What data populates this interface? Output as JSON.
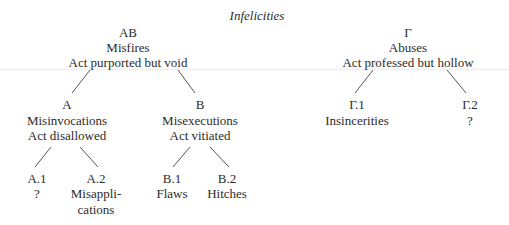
{
  "title": "Infelicities",
  "nodes": {
    "AB": {
      "code": "AB",
      "name": "Misfires",
      "desc": "Act purported but void"
    },
    "Gamma": {
      "code": "Γ",
      "name": "Abuses",
      "desc": "Act professed but hollow"
    },
    "A": {
      "code": "A",
      "name": "Misinvocations",
      "desc": "Act disallowed"
    },
    "B": {
      "code": "B",
      "name": "Misexecutions",
      "desc": "Act vitiated"
    },
    "Gamma1": {
      "code": "Γ.1",
      "name": "Insincerities"
    },
    "Gamma2": {
      "code": "Γ.2",
      "name": "?"
    },
    "A1": {
      "code": "A.1",
      "name": "?"
    },
    "A2": {
      "code": "A.2",
      "name_line1": "Misappli-",
      "name_line2": "cations"
    },
    "B1": {
      "code": "B.1",
      "name": "Flaws"
    },
    "B2": {
      "code": "B.2",
      "name": "Hitches"
    }
  },
  "edges": [
    {
      "from": "AB",
      "to": "A"
    },
    {
      "from": "AB",
      "to": "B"
    },
    {
      "from": "Gamma",
      "to": "Gamma1"
    },
    {
      "from": "Gamma",
      "to": "Gamma2"
    },
    {
      "from": "A",
      "to": "A1"
    },
    {
      "from": "A",
      "to": "A2"
    },
    {
      "from": "B",
      "to": "B1"
    },
    {
      "from": "B",
      "to": "B2"
    }
  ],
  "colors": {
    "text": "#2b2b2b",
    "line": "#555555",
    "background": "#ffffff"
  }
}
